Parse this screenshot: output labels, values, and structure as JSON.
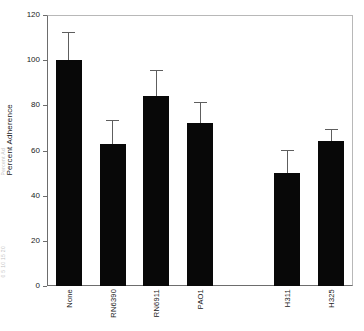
{
  "figure": {
    "background_color": "#ffffff",
    "bar_color": "#080808",
    "error_bar_color": "#5e5e5e",
    "axis_color": "#6d6d6d"
  },
  "edge_artifacts": {
    "top_text": "Percent Ad",
    "bottom_text": "0 5 10 15 20"
  },
  "chart_data": {
    "type": "bar",
    "title": "",
    "xlabel": "",
    "ylabel": "Percent Adherence",
    "ylim": [
      0,
      120
    ],
    "ytick_labels": [
      "0",
      "20",
      "40",
      "60",
      "80",
      "100",
      "120"
    ],
    "ytick_values": [
      0,
      20,
      40,
      60,
      80,
      100,
      120
    ],
    "grid": false,
    "legend": false,
    "orientation": "vertical",
    "error_bars": "upper-only",
    "categories": [
      "None",
      "RN6390",
      "RN6911",
      "PAO1",
      "",
      "H311",
      "H325"
    ],
    "values": [
      100,
      63,
      84,
      72,
      null,
      50,
      64
    ],
    "errors_upper": [
      112,
      73,
      95,
      81,
      null,
      60,
      69
    ],
    "bars": [
      {
        "category": "None",
        "value": 100,
        "error_top": 112
      },
      {
        "category": "RN6390",
        "value": 63,
        "error_top": 73
      },
      {
        "category": "RN6911",
        "value": 84,
        "error_top": 95
      },
      {
        "category": "PAO1",
        "value": 72,
        "error_top": 81
      },
      {
        "category": "",
        "value": null,
        "error_top": null
      },
      {
        "category": "H311",
        "value": 50,
        "error_top": 60
      },
      {
        "category": "H325",
        "value": 64,
        "error_top": 69
      }
    ]
  }
}
